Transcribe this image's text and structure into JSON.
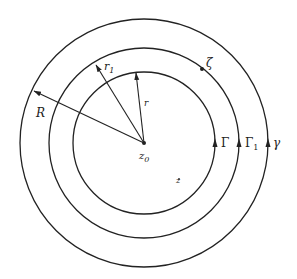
{
  "diagram": {
    "type": "concentric-circles",
    "center": {
      "x": 144,
      "y": 143,
      "label": "z",
      "subscript": "0"
    },
    "circles": [
      {
        "name": "Gamma",
        "radius": 71,
        "label": "Γ",
        "subscript": ""
      },
      {
        "name": "Gamma1",
        "radius": 95,
        "label": "Γ",
        "subscript": "1"
      },
      {
        "name": "gamma",
        "radius": 124,
        "label": "γ",
        "subscript": ""
      }
    ],
    "radii": [
      {
        "label": "r",
        "subscript": "",
        "target_circle": "Gamma"
      },
      {
        "label": "r",
        "subscript": "1",
        "target_circle": "Gamma1"
      },
      {
        "label": "R",
        "subscript": "",
        "target_circle": "gamma"
      }
    ],
    "points": [
      {
        "label": "ζ",
        "on_circle": "Gamma1"
      },
      {
        "label": "z",
        "position": "between Gamma and Gamma1"
      }
    ],
    "stroke_color": "#222222"
  }
}
